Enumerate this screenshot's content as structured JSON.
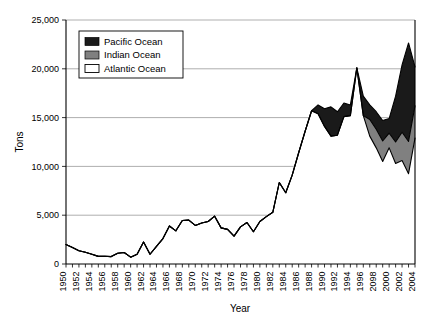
{
  "chart_data": {
    "type": "area",
    "title": "",
    "xlabel": "Year",
    "ylabel": "Tons",
    "ylim": [
      0,
      25000
    ],
    "xlim": [
      1950,
      2004
    ],
    "grid": true,
    "legend_position": "top-left-inside",
    "stacked": true,
    "ytick_labels": [
      "0",
      "5,000",
      "10,000",
      "15,000",
      "20,000",
      "25,000"
    ],
    "ytick_values": [
      0,
      5000,
      10000,
      15000,
      20000,
      25000
    ],
    "xtick_labels": [
      "1950",
      "1952",
      "1954",
      "1956",
      "1958",
      "1960",
      "1962",
      "1964",
      "1966",
      "1968",
      "1970",
      "1972",
      "1974",
      "1976",
      "1978",
      "1980",
      "1982",
      "1984",
      "1986",
      "1988",
      "1990",
      "1992",
      "1994",
      "1996",
      "2098",
      "2000",
      "2002",
      "2004"
    ],
    "x": [
      1950,
      1951,
      1952,
      1953,
      1954,
      1955,
      1956,
      1957,
      1958,
      1959,
      1960,
      1961,
      1962,
      1963,
      1964,
      1965,
      1966,
      1967,
      1968,
      1969,
      1970,
      1971,
      1972,
      1973,
      1974,
      1975,
      1976,
      1977,
      1978,
      1979,
      1980,
      1981,
      1982,
      1983,
      1984,
      1985,
      1986,
      1987,
      1988,
      1989,
      1990,
      1991,
      1992,
      1993,
      1994,
      1995,
      1996,
      1997,
      1998,
      1999,
      2000,
      2001,
      2002,
      2003,
      2004
    ],
    "series": [
      {
        "name": "Atlantic Ocean",
        "color": "#ffffff",
        "values": [
          2000,
          1700,
          1350,
          1200,
          1000,
          780,
          800,
          760,
          1100,
          1180,
          700,
          1000,
          2250,
          1000,
          1800,
          2600,
          3900,
          3400,
          4450,
          4500,
          3950,
          4200,
          4350,
          4900,
          3700,
          3550,
          2850,
          3800,
          4250,
          3300,
          4350,
          4850,
          5300,
          8350,
          7300,
          9100,
          11400,
          13600,
          15700,
          15400,
          14100,
          13100,
          13200,
          15100,
          15200,
          20100,
          15200,
          13100,
          11900,
          10500,
          11900,
          10300,
          10600,
          9250,
          12900
        ]
      },
      {
        "name": "Indian Ocean",
        "color": "#808080",
        "values": [
          0,
          0,
          0,
          0,
          0,
          0,
          0,
          0,
          0,
          0,
          0,
          0,
          0,
          0,
          0,
          0,
          0,
          0,
          0,
          0,
          0,
          0,
          0,
          0,
          0,
          0,
          0,
          0,
          0,
          0,
          0,
          0,
          0,
          0,
          0,
          0,
          0,
          0,
          0,
          0,
          0,
          0,
          0,
          0,
          0,
          0,
          0,
          1700,
          1900,
          2100,
          1500,
          2200,
          2900,
          3300,
          3300
        ]
      },
      {
        "name": "Pacific Ocean",
        "color": "#1a1a1a",
        "values": [
          0,
          0,
          0,
          0,
          0,
          0,
          0,
          0,
          0,
          0,
          0,
          0,
          0,
          0,
          0,
          0,
          0,
          0,
          0,
          0,
          0,
          0,
          0,
          0,
          0,
          0,
          0,
          0,
          0,
          0,
          0,
          0,
          0,
          0,
          0,
          0,
          0,
          0,
          0,
          900,
          1800,
          3000,
          2400,
          1400,
          1100,
          0,
          2000,
          1500,
          1800,
          2100,
          1500,
          4700,
          6900,
          10100,
          4000
        ]
      }
    ]
  },
  "legend": {
    "items": [
      {
        "label": "Pacific Ocean",
        "color": "#1a1a1a"
      },
      {
        "label": "Indian Ocean",
        "color": "#808080"
      },
      {
        "label": "Atlantic Ocean",
        "color": "#ffffff"
      }
    ]
  },
  "axes": {
    "y_title": "Tons",
    "x_title": "Year"
  }
}
